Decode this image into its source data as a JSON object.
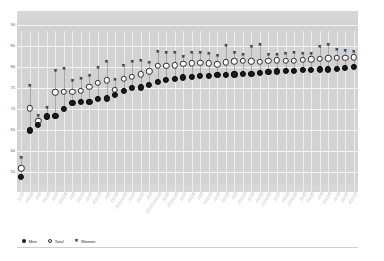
{
  "chart_data": {
    "type": "scatter",
    "title": "",
    "subtitle": "",
    "xlabel": "",
    "ylabel": "",
    "ylim": [
      52,
      91
    ],
    "yticks": [
      90,
      85,
      80,
      75,
      70,
      65,
      60,
      55
    ],
    "ytick_labels": [
      "90",
      "85",
      "80",
      "75",
      "70",
      "65",
      "60",
      "55"
    ],
    "grid": "horizontal-and-vertical",
    "legend_position": "bottom-left",
    "legend": [
      "Men",
      "Total",
      "Women"
    ],
    "marker_styles": {
      "Men": "filled-circle",
      "Total": "open-circle",
      "Women": "asterisk"
    },
    "categories": [
      "╱╱╱╱╱",
      "╱╱╱╱╱╱",
      "╱╱╱╱",
      "╱╱╱╱╱╱",
      "╱╱╱╱╱",
      "╱╱╱╱╱╱╱",
      "╱╱╱╱",
      "╱╱╱╱╱╱",
      "╱╱╱╱╱",
      "╱╱╱╱╱╱╱",
      "╱╱╱╱",
      "╱╱╱╱╱╱",
      "╱╱╱╱╱╱╱╱╱╱",
      "╱╱╱╱╱",
      "╱╱╱╱╱╱",
      "╱╱╱╱",
      "╱╱╱╱╱╱╱╱╱╱╱╱╱",
      "╱╱╱╱╱",
      "╱╱╱╱╱╱╱╱╱",
      "╱╱╱╱╱",
      "╱╱╱╱╱╱",
      "╱╱╱╱",
      "╱╱╱╱╱╱╱",
      "╱╱╱╱╱",
      "╱╱╱╱╱╱",
      "╱╱╱╱",
      "╱╱╱╱╱╱╱",
      "╱╱╱╱╱",
      "╱╱╱╱╱╱",
      "╱╱╱╱╱╱╱╱",
      "╱╱╱╱╱",
      "╱╱╱╱╱╱",
      "╱╱╱╱╱╱╱╱",
      "╱╱╱╱╱",
      "╱╱╱╱╱╱",
      "╱╱╱╱",
      "╱╱╱╱╱╱╱",
      "╱╱╱╱╱",
      "╱╱╱╱╱╱",
      "╱╱╱╱╱╱╱"
    ],
    "series": [
      {
        "name": "Men",
        "marker": "filled-circle",
        "color": "#1a1a1a",
        "values": [
          54.0,
          65.0,
          66.3,
          68.3,
          68.4,
          70.0,
          71.5,
          71.7,
          71.8,
          72.4,
          72.6,
          73.5,
          74.3,
          75.0,
          75.2,
          75.8,
          76.6,
          77.0,
          77.2,
          77.6,
          77.8,
          77.9,
          78.0,
          78.1,
          78.2,
          78.3,
          78.4,
          78.5,
          78.6,
          78.8,
          79.0,
          79.1,
          79.2,
          79.3,
          79.4,
          79.5,
          79.5,
          79.6,
          79.8,
          80.0
        ]
      },
      {
        "name": "Total",
        "marker": "open-circle",
        "color": "#ffffff",
        "values": [
          56.0,
          70.2,
          67.2,
          68.2,
          74.0,
          74.1,
          74.2,
          74.4,
          75.3,
          76.3,
          76.9,
          74.6,
          77.2,
          77.8,
          78.3,
          79.0,
          80.3,
          80.4,
          80.5,
          80.8,
          80.9,
          81.0,
          80.9,
          80.7,
          81.2,
          81.4,
          81.5,
          81.4,
          81.3,
          81.6,
          81.7,
          81.6,
          81.5,
          81.8,
          81.9,
          82.0,
          82.1,
          82.2,
          82.3,
          82.4
        ]
      },
      {
        "name": "Women",
        "marker": "asterisk",
        "color": "#2b2b2b",
        "values": [
          58.5,
          75.5,
          68.5,
          70.2,
          79.2,
          79.5,
          76.8,
          77.3,
          78.0,
          79.8,
          81.2,
          77.0,
          80.4,
          81.2,
          81.4,
          81.0,
          83.6,
          83.5,
          83.3,
          82.5,
          83.4,
          83.5,
          83.2,
          82.7,
          85.0,
          83.3,
          82.8,
          84.8,
          85.3,
          83.0,
          83.0,
          83.2,
          83.3,
          83.2,
          83.1,
          84.9,
          85.3,
          84.0,
          83.9,
          83.7
        ]
      }
    ]
  },
  "legend": {
    "men_label": "Men",
    "total_label": "Total",
    "women_label": "Women",
    "women_glyph": "✖"
  }
}
